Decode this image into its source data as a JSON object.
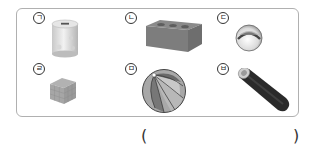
{
  "problem": {
    "items": [
      {
        "label": "ㄱ",
        "object": "cylinder-coin-bank"
      },
      {
        "label": "ㄴ",
        "object": "rectangular-brick"
      },
      {
        "label": "ㄷ",
        "object": "sphere-ball"
      },
      {
        "label": "ㄹ",
        "object": "cube-puzzle"
      },
      {
        "label": "ㅁ",
        "object": "beach-ball-sphere"
      },
      {
        "label": "ㅂ",
        "object": "cylinder-tube"
      }
    ],
    "answer": {
      "open_paren": "(",
      "close_paren": ")",
      "value": ""
    }
  }
}
